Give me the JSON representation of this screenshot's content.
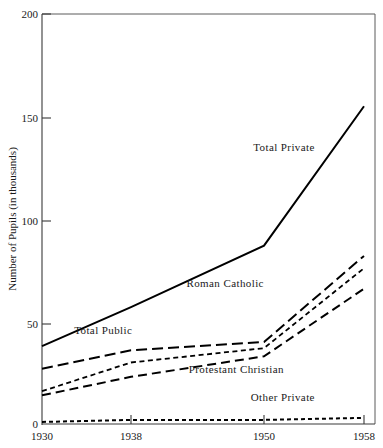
{
  "chart_data": {
    "type": "line",
    "title": "",
    "xlabel": "",
    "ylabel": "Number of Pupils (in thousands)",
    "x": [
      1930,
      1938,
      1950,
      1958
    ],
    "xtick_labels": [
      "1930",
      "1938",
      "1950",
      "1958"
    ],
    "ytick_labels": [
      "0",
      "50",
      "100",
      "150",
      "200"
    ],
    "ytick_values": [
      0,
      50,
      100,
      150,
      200
    ],
    "ylim": [
      0,
      200
    ],
    "xlim": [
      1930,
      1958
    ],
    "grid": false,
    "legend_position": "inline-annotations",
    "series": [
      {
        "name": "Total Private",
        "label": "Total Private",
        "style": "solid",
        "values": [
          38,
          57,
          87,
          155
        ]
      },
      {
        "name": "Total Public",
        "label": "Total Public",
        "style": "long-dash",
        "values": [
          27,
          36,
          40,
          82
        ]
      },
      {
        "name": "Roman Catholic",
        "label": "Roman Catholic",
        "style": "short-dash",
        "values": [
          16,
          30,
          37,
          76
        ]
      },
      {
        "name": "Protestant Christian",
        "label": "Protestant Christian",
        "style": "medium-dash",
        "values": [
          14,
          23,
          33,
          66
        ]
      },
      {
        "name": "Other Private",
        "label": "Other Private",
        "style": "dotted",
        "values": [
          1,
          2,
          2,
          3
        ]
      }
    ],
    "annotations": [
      {
        "text": "Total Private",
        "x": 1951.6,
        "y": 133
      },
      {
        "text": "Roman Catholic",
        "x": 1946.5,
        "y": 67
      },
      {
        "text": "Total Public",
        "x": 1935.5,
        "y": 44
      },
      {
        "text": "Protestant Christian",
        "x": 1947.5,
        "y": 25
      },
      {
        "text": "Other Private",
        "x": 1951.5,
        "y": 11
      }
    ]
  },
  "labels": {
    "ylabel": "Number of Pupils (in thousands)",
    "y_200": "200",
    "y_150": "150",
    "y_100": "100",
    "y_50": "50",
    "y_0": "0",
    "x_1930": "1930",
    "x_1938": "1938",
    "x_1950": "1950",
    "x_1958": "1958",
    "s_total_private": "Total Private",
    "s_roman_catholic": "Roman Catholic",
    "s_total_public": "Total Public",
    "s_protestant_christian": "Protestant Christian",
    "s_other_private": "Other Private"
  }
}
